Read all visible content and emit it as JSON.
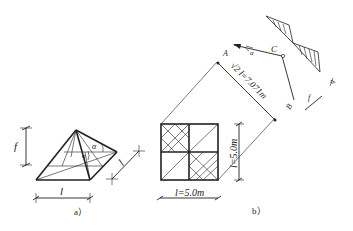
{
  "figure_a": {
    "caption": "a）",
    "dim_height_label": "f",
    "dim_base_label": "l",
    "dim_side_label": "l",
    "angle_label_1": "α",
    "angle_label_2": "α"
  },
  "figure_b": {
    "caption": "b）",
    "dim_bottom_label": "l=5.0m",
    "dim_right_label": "l=5.0m",
    "dim_diagonal_label": "√2 l=7.071m",
    "point_a_label": "A",
    "point_b_label": "B",
    "point_c_label": "C",
    "angle_label": "α",
    "load_label": "q",
    "rise_label": "f"
  }
}
